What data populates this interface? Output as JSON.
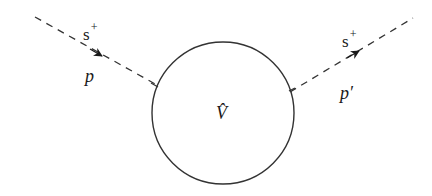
{
  "diagram": {
    "type": "scattering-vertex",
    "vertex": {
      "label": "V̂",
      "shape": "circle",
      "center": [
        223,
        113
      ],
      "radius": 71
    },
    "incoming": {
      "particle": "s",
      "charge": "+",
      "momentum": "p",
      "line_style": "dashed",
      "arrow": "toward-vertex"
    },
    "outgoing": {
      "particle": "s",
      "charge": "+",
      "momentum": "p′",
      "line_style": "dashed",
      "arrow": "away-from-vertex"
    },
    "colors": {
      "stroke": "#333333",
      "text": "#1a1a1a",
      "background": "#ffffff"
    }
  }
}
